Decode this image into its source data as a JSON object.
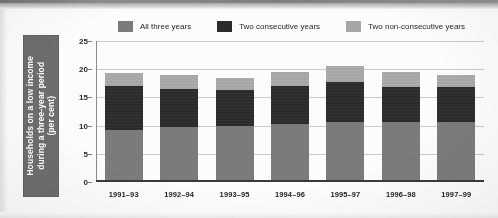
{
  "axis_title": {
    "line1": "Households on a low income",
    "line2": "during a three-year period",
    "line3": "(per cent)"
  },
  "legend": {
    "items": [
      {
        "label": "All three years",
        "color": "#7b7b7b",
        "name": "legend-all-three-years"
      },
      {
        "label": "Two consecutive years",
        "color": "#2b2b2b",
        "name": "legend-two-consecutive-years"
      },
      {
        "label": "Two non-consecutive years",
        "color": "#a6a6a6",
        "name": "legend-two-non-consecutive-years"
      }
    ]
  },
  "y_ticks": [
    "0",
    "5",
    "10",
    "15",
    "20",
    "25"
  ],
  "x_labels": [
    "1991–93",
    "1992–94",
    "1993–95",
    "1994–96",
    "1995–97",
    "1996–98",
    "1997–99"
  ],
  "chart_data": {
    "type": "bar",
    "title": "",
    "subtype": "stacked",
    "xlabel": "",
    "ylabel": "Households on a low income during a three-year period (per cent)",
    "ylim": [
      0,
      25
    ],
    "yticks": [
      0,
      5,
      10,
      15,
      20,
      25
    ],
    "grid": true,
    "legend_position": "top",
    "categories": [
      "1991–93",
      "1992–94",
      "1993–95",
      "1994–96",
      "1995–97",
      "1996–98",
      "1997–99"
    ],
    "series": [
      {
        "name": "All three years",
        "color": "#7b7b7b",
        "values": [
          9.2,
          9.7,
          10.0,
          10.3,
          10.6,
          10.6,
          10.7
        ]
      },
      {
        "name": "Two consecutive years",
        "color": "#2b2b2b",
        "values": [
          7.8,
          6.8,
          6.4,
          6.8,
          7.2,
          6.3,
          6.1
        ]
      },
      {
        "name": "Two non-consecutive years",
        "color": "#a6a6a6",
        "values": [
          2.4,
          2.5,
          2.1,
          2.4,
          2.7,
          2.6,
          2.2
        ]
      }
    ],
    "totals": [
      19.4,
      19.0,
      18.5,
      19.5,
      20.5,
      19.5,
      19.0
    ]
  }
}
